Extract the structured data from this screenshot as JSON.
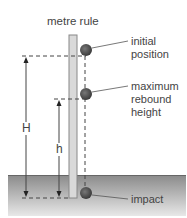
{
  "diagram": {
    "ruler_label": "metre rule",
    "labels": {
      "initial": [
        "initial",
        "position"
      ],
      "rebound": [
        "maximum",
        "rebound",
        "height"
      ],
      "impact": "impact"
    },
    "dimensions": {
      "drop_height": "H",
      "rebound_height": "h"
    },
    "colors": {
      "ground_top": "#8a8a8a",
      "ground_bottom": "#e6e6e6",
      "ruler_fill": "#d8d8d8",
      "ball": "#555555",
      "line": "#333333"
    }
  }
}
